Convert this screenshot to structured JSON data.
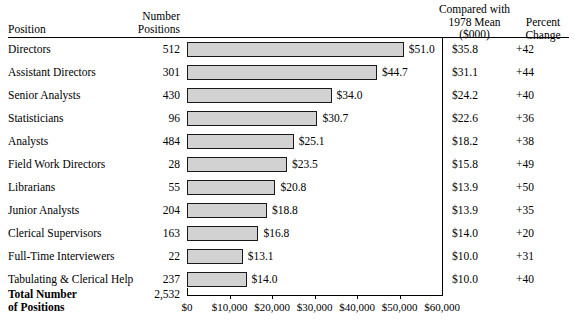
{
  "headers": {
    "position": "Position",
    "number_positions": "Number\nPositions",
    "compared_with": "Compared with\n1978 Mean\n($000)",
    "percent_change": "Percent\nChange"
  },
  "total": {
    "label": "Total Number\nof Positions",
    "count": "2,532"
  },
  "colors": {
    "bar_fill": "#d2d2d2",
    "bar_stroke": "#1a1a1a",
    "rule": "#000000",
    "background": "#ffffff"
  },
  "chart_data": {
    "type": "bar",
    "title": "",
    "xlabel": "",
    "ylabel": "Position",
    "orientation": "horizontal",
    "grid": false,
    "legend": "none",
    "xlim": [
      0,
      60000
    ],
    "xtick_labels": [
      "$0",
      "$10,000",
      "$20,000",
      "$30,000",
      "$40,000",
      "$50,000",
      "$60,000"
    ],
    "xtick_values": [
      0,
      10000,
      20000,
      30000,
      40000,
      50000,
      60000
    ],
    "categories": [
      "Directors",
      "Assistant Directors",
      "Senior Analysts",
      "Statisticians",
      "Analysts",
      "Field Work Directors",
      "Librarians",
      "Junior Analysts",
      "Clerical Supervisors",
      "Full-Time Interviewers",
      "Tabulating & Clerical Help"
    ],
    "values": [
      51.0,
      44.7,
      34.0,
      30.7,
      25.1,
      23.5,
      20.8,
      18.8,
      16.8,
      13.1,
      14.0
    ],
    "value_labels": [
      "$51.0",
      "$44.7",
      "$34.0",
      "$30.7",
      "$25.1",
      "$23.5",
      "$20.8",
      "$18.8",
      "$16.8",
      "$13.1",
      "$14.0"
    ],
    "series": [
      {
        "name": "Number Positions",
        "values": [
          512,
          301,
          430,
          96,
          484,
          28,
          55,
          204,
          163,
          22,
          237
        ]
      },
      {
        "name": "Compared with 1978 Mean ($000)",
        "values": [
          35.8,
          31.1,
          24.2,
          22.6,
          18.2,
          15.8,
          13.9,
          13.9,
          14.0,
          10.0,
          10.0
        ]
      },
      {
        "name": "Percent Change",
        "values": [
          42,
          44,
          40,
          36,
          38,
          49,
          50,
          35,
          20,
          31,
          40
        ]
      }
    ]
  },
  "rows": [
    {
      "position": "Directors",
      "count": "512",
      "value_label": "$51.0",
      "value": 51.0,
      "mean": "$35.8",
      "pct": "+42"
    },
    {
      "position": "Assistant Directors",
      "count": "301",
      "value_label": "$44.7",
      "value": 44.7,
      "mean": "$31.1",
      "pct": "+44"
    },
    {
      "position": "Senior Analysts",
      "count": "430",
      "value_label": "$34.0",
      "value": 34.0,
      "mean": "$24.2",
      "pct": "+40"
    },
    {
      "position": "Statisticians",
      "count": "96",
      "value_label": "$30.7",
      "value": 30.7,
      "mean": "$22.6",
      "pct": "+36"
    },
    {
      "position": "Analysts",
      "count": "484",
      "value_label": "$25.1",
      "value": 25.1,
      "mean": "$18.2",
      "pct": "+38"
    },
    {
      "position": "Field Work Directors",
      "count": "28",
      "value_label": "$23.5",
      "value": 23.5,
      "mean": "$15.8",
      "pct": "+49"
    },
    {
      "position": "Librarians",
      "count": "55",
      "value_label": "$20.8",
      "value": 20.8,
      "mean": "$13.9",
      "pct": "+50"
    },
    {
      "position": "Junior Analysts",
      "count": "204",
      "value_label": "$18.8",
      "value": 18.8,
      "mean": "$13.9",
      "pct": "+35"
    },
    {
      "position": "Clerical Supervisors",
      "count": "163",
      "value_label": "$16.8",
      "value": 16.8,
      "mean": "$14.0",
      "pct": "+20"
    },
    {
      "position": "Full-Time Interviewers",
      "count": "22",
      "value_label": "$13.1",
      "value": 13.1,
      "mean": "$10.0",
      "pct": "+31"
    },
    {
      "position": "Tabulating & Clerical Help",
      "count": "237",
      "value_label": "$14.0",
      "value": 14.0,
      "mean": "$10.0",
      "pct": "+40"
    }
  ]
}
